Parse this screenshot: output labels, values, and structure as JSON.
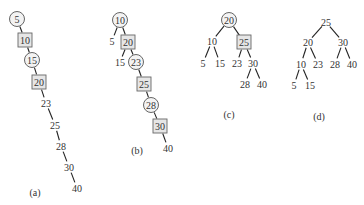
{
  "diagrams": [
    {
      "id": "a",
      "caption": "(a)",
      "nodes": [
        {
          "key": "5",
          "label": "5",
          "shape": "circle"
        },
        {
          "key": "10",
          "label": "10",
          "shape": "square"
        },
        {
          "key": "15",
          "label": "15",
          "shape": "circle"
        },
        {
          "key": "20",
          "label": "20",
          "shape": "square"
        },
        {
          "key": "23",
          "label": "23",
          "shape": "plain"
        },
        {
          "key": "25",
          "label": "25",
          "shape": "plain"
        },
        {
          "key": "28",
          "label": "28",
          "shape": "plain"
        },
        {
          "key": "30",
          "label": "30",
          "shape": "plain"
        },
        {
          "key": "40",
          "label": "40",
          "shape": "plain"
        }
      ],
      "edges": [
        [
          "5",
          "10"
        ],
        [
          "10",
          "15"
        ],
        [
          "15",
          "20"
        ],
        [
          "20",
          "23"
        ],
        [
          "23",
          "25"
        ],
        [
          "25",
          "28"
        ],
        [
          "28",
          "30"
        ],
        [
          "30",
          "40"
        ]
      ]
    },
    {
      "id": "b",
      "caption": "(b)",
      "nodes": [
        {
          "key": "10",
          "label": "10",
          "shape": "circle"
        },
        {
          "key": "5",
          "label": "5",
          "shape": "plain"
        },
        {
          "key": "20",
          "label": "20",
          "shape": "square"
        },
        {
          "key": "15",
          "label": "15",
          "shape": "plain"
        },
        {
          "key": "23",
          "label": "23",
          "shape": "circle"
        },
        {
          "key": "25",
          "label": "25",
          "shape": "square"
        },
        {
          "key": "28",
          "label": "28",
          "shape": "circle"
        },
        {
          "key": "30",
          "label": "30",
          "shape": "square"
        },
        {
          "key": "40",
          "label": "40",
          "shape": "plain"
        }
      ],
      "edges": [
        [
          "10",
          "5"
        ],
        [
          "10",
          "20"
        ],
        [
          "20",
          "15"
        ],
        [
          "20",
          "23"
        ],
        [
          "23",
          "25"
        ],
        [
          "25",
          "28"
        ],
        [
          "28",
          "30"
        ],
        [
          "30",
          "40"
        ]
      ]
    },
    {
      "id": "c",
      "caption": "(c)",
      "nodes": [
        {
          "key": "20",
          "label": "20",
          "shape": "circle"
        },
        {
          "key": "10",
          "label": "10",
          "shape": "plain"
        },
        {
          "key": "25",
          "label": "25",
          "shape": "square"
        },
        {
          "key": "5",
          "label": "5",
          "shape": "plain"
        },
        {
          "key": "15",
          "label": "15",
          "shape": "plain"
        },
        {
          "key": "23",
          "label": "23",
          "shape": "plain"
        },
        {
          "key": "30",
          "label": "30",
          "shape": "plain"
        },
        {
          "key": "28",
          "label": "28",
          "shape": "plain"
        },
        {
          "key": "40",
          "label": "40",
          "shape": "plain"
        }
      ],
      "edges": [
        [
          "20",
          "10"
        ],
        [
          "20",
          "25"
        ],
        [
          "10",
          "5"
        ],
        [
          "10",
          "15"
        ],
        [
          "25",
          "23"
        ],
        [
          "25",
          "30"
        ],
        [
          "30",
          "28"
        ],
        [
          "30",
          "40"
        ]
      ]
    },
    {
      "id": "d",
      "caption": "(d)",
      "nodes": [
        {
          "key": "25",
          "label": "25",
          "shape": "plain"
        },
        {
          "key": "20",
          "label": "20",
          "shape": "plain"
        },
        {
          "key": "30",
          "label": "30",
          "shape": "plain"
        },
        {
          "key": "10",
          "label": "10",
          "shape": "plain"
        },
        {
          "key": "23",
          "label": "23",
          "shape": "plain"
        },
        {
          "key": "28",
          "label": "28",
          "shape": "plain"
        },
        {
          "key": "40",
          "label": "40",
          "shape": "plain"
        },
        {
          "key": "5",
          "label": "5",
          "shape": "plain"
        },
        {
          "key": "15",
          "label": "15",
          "shape": "plain"
        }
      ],
      "edges": [
        [
          "25",
          "20"
        ],
        [
          "25",
          "30"
        ],
        [
          "20",
          "10"
        ],
        [
          "20",
          "23"
        ],
        [
          "30",
          "28"
        ],
        [
          "30",
          "40"
        ],
        [
          "10",
          "5"
        ],
        [
          "10",
          "15"
        ]
      ]
    }
  ]
}
